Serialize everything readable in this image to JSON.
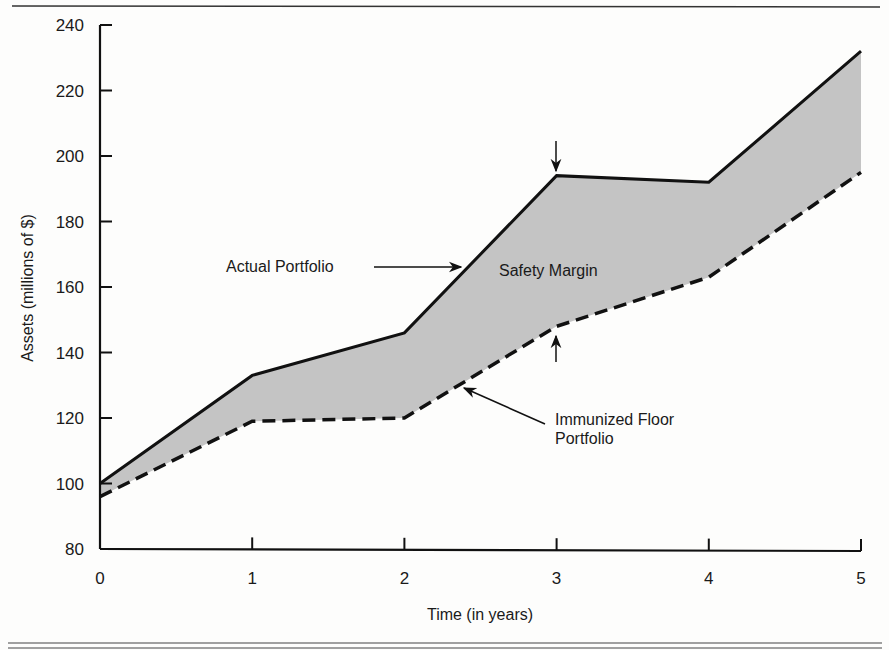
{
  "chart_data": {
    "type": "area",
    "title": "",
    "xlabel": "Time (in years)",
    "ylabel": "Assets (millions of $)",
    "x": [
      0,
      1,
      2,
      3,
      4,
      5
    ],
    "xticks": [
      "0",
      "1",
      "2",
      "3",
      "4",
      "5"
    ],
    "yticks": [
      "80",
      "100",
      "120",
      "140",
      "160",
      "180",
      "200",
      "220",
      "240"
    ],
    "ylim": [
      80,
      240
    ],
    "xlim": [
      0,
      5
    ],
    "grid": false,
    "legend": "none (inline annotations)",
    "series": [
      {
        "name": "Actual Portfolio",
        "style": "solid",
        "values": [
          100,
          133,
          146,
          194,
          192,
          232
        ]
      },
      {
        "name": "Immunized Floor Portfolio",
        "style": "dashed",
        "values": [
          96,
          119,
          120,
          148,
          163,
          195
        ]
      }
    ],
    "shaded_region": {
      "between": [
        "Actual Portfolio",
        "Immunized Floor Portfolio"
      ],
      "label": "Safety Margin",
      "color": "#c4c4c4"
    },
    "annotations": [
      {
        "text": "Actual Portfolio",
        "points_to": "Actual Portfolio line near x=2.35"
      },
      {
        "text": "Safety Margin",
        "at": "inside shaded region near x=3"
      },
      {
        "text": "Immunized Floor Portfolio",
        "points_to": "Immunized Floor line near x=2.4"
      },
      {
        "text": "arrows",
        "at": "x=3 above actual and below floor, indicating the margin"
      }
    ]
  },
  "labels": {
    "actual": "Actual Portfolio",
    "margin": "Safety Margin",
    "floor_line1": "Immunized Floor",
    "floor_line2": "Portfolio",
    "xlabel": "Time (in years)",
    "ylabel": "Assets (millions of $)"
  },
  "colors": {
    "line": "#111111",
    "fill": "#c4c4c4",
    "background": "#fdfdfc"
  }
}
